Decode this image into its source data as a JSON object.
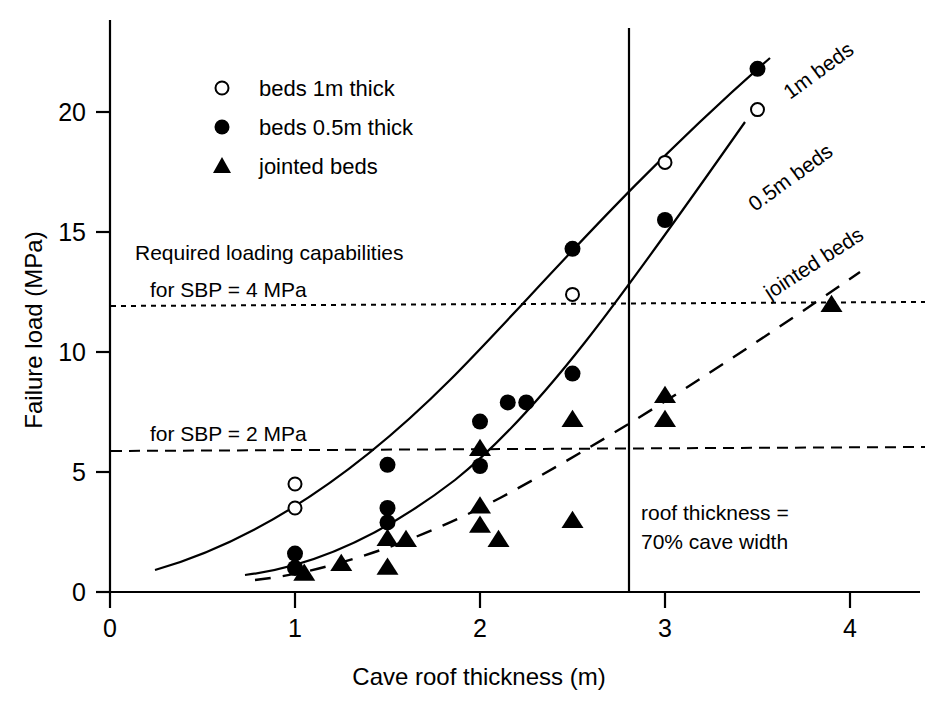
{
  "chart_data": {
    "type": "scatter",
    "title": "",
    "xlabel": "Cave roof thickness (m)",
    "ylabel": "Failure load (MPa)",
    "xlim": [
      0,
      4.5
    ],
    "ylim": [
      0,
      23
    ],
    "xticks": [
      "0",
      "1",
      "2",
      "3",
      "4"
    ],
    "xtick_values": [
      0,
      1,
      2,
      3,
      4
    ],
    "yticks": [
      "0",
      "5",
      "10",
      "15",
      "20"
    ],
    "ytick_values": [
      0,
      5,
      10,
      15,
      20
    ],
    "grid": false,
    "legend_position": "upper-left-inside",
    "series": [
      {
        "name": "beds 1m thick",
        "marker": "open-circle",
        "points": [
          {
            "x": 1.0,
            "y": 4.5
          },
          {
            "x": 1.0,
            "y": 3.5
          },
          {
            "x": 2.5,
            "y": 12.4
          },
          {
            "x": 3.0,
            "y": 17.9
          },
          {
            "x": 3.5,
            "y": 20.1
          }
        ]
      },
      {
        "name": "beds 0.5m thick",
        "marker": "filled-circle",
        "points": [
          {
            "x": 1.0,
            "y": 1.6
          },
          {
            "x": 1.0,
            "y": 1.0
          },
          {
            "x": 1.5,
            "y": 5.3
          },
          {
            "x": 1.5,
            "y": 3.5
          },
          {
            "x": 1.5,
            "y": 2.9
          },
          {
            "x": 2.0,
            "y": 7.1
          },
          {
            "x": 2.0,
            "y": 5.25
          },
          {
            "x": 2.15,
            "y": 7.9
          },
          {
            "x": 2.25,
            "y": 7.9
          },
          {
            "x": 2.5,
            "y": 14.3
          },
          {
            "x": 2.5,
            "y": 9.1
          },
          {
            "x": 3.0,
            "y": 15.5
          },
          {
            "x": 3.5,
            "y": 21.8
          }
        ]
      },
      {
        "name": "jointed beds",
        "marker": "filled-triangle",
        "points": [
          {
            "x": 1.05,
            "y": 0.8
          },
          {
            "x": 1.25,
            "y": 1.2
          },
          {
            "x": 1.5,
            "y": 2.25
          },
          {
            "x": 1.6,
            "y": 2.2
          },
          {
            "x": 1.5,
            "y": 1.05
          },
          {
            "x": 2.0,
            "y": 6.0
          },
          {
            "x": 2.0,
            "y": 3.6
          },
          {
            "x": 2.0,
            "y": 2.8
          },
          {
            "x": 2.1,
            "y": 2.2
          },
          {
            "x": 2.5,
            "y": 7.2
          },
          {
            "x": 2.5,
            "y": 3.0
          },
          {
            "x": 3.0,
            "y": 8.2
          },
          {
            "x": 3.0,
            "y": 7.2
          },
          {
            "x": 3.9,
            "y": 12.0
          }
        ]
      }
    ],
    "trend_curves": [
      {
        "name": "1m beds",
        "style": "solid",
        "label": "1m beds"
      },
      {
        "name": "0.5m beds",
        "style": "solid",
        "label": "0.5m beds"
      },
      {
        "name": "jointed beds",
        "style": "dashed",
        "label": "jointed beds"
      }
    ],
    "reference_lines": [
      {
        "name": "sbp-4",
        "orientation": "horizontal",
        "value": 11.9,
        "style": "dotted",
        "label": "for SBP = 4 MPa"
      },
      {
        "name": "sbp-2",
        "orientation": "horizontal",
        "value": 5.9,
        "style": "dashed",
        "label": "for SBP = 2 MPa"
      },
      {
        "name": "roof-thickness",
        "orientation": "vertical",
        "value": 2.8,
        "style": "solid",
        "label": "roof thickness = 70% cave width"
      }
    ],
    "annotations": [
      {
        "name": "required-loading",
        "text": "Required loading capabilities"
      },
      {
        "name": "sbp-4-label",
        "text": "for SBP = 4 MPa"
      },
      {
        "name": "sbp-2-label",
        "text": "for SBP = 2 MPa"
      },
      {
        "name": "roof-thickness-line-1",
        "text": "roof thickness ="
      },
      {
        "name": "roof-thickness-line-2",
        "text": "70% cave width"
      }
    ]
  },
  "legend": {
    "items": [
      {
        "label": "beds 1m thick",
        "marker": "open-circle"
      },
      {
        "label": "beds 0.5m thick",
        "marker": "filled-circle"
      },
      {
        "label": "jointed beds",
        "marker": "filled-triangle"
      }
    ]
  },
  "axes": {
    "x_title": "Cave roof thickness (m)",
    "y_title": "Failure load (MPa)",
    "x_tick_labels": [
      "0",
      "1",
      "2",
      "3",
      "4"
    ],
    "y_tick_labels": [
      "0",
      "5",
      "10",
      "15",
      "20"
    ]
  },
  "curve_labels": {
    "one_m": "1m beds",
    "half_m": "0.5m beds",
    "jointed": "jointed beds"
  },
  "annotations": {
    "required_loading": "Required loading capabilities",
    "sbp4": "for SBP = 4 MPa",
    "sbp2": "for SBP = 2 MPa",
    "roof_line1": "roof thickness =",
    "roof_line2": "70% cave width"
  },
  "colors": {
    "ink": "#000000",
    "background": "#ffffff"
  }
}
